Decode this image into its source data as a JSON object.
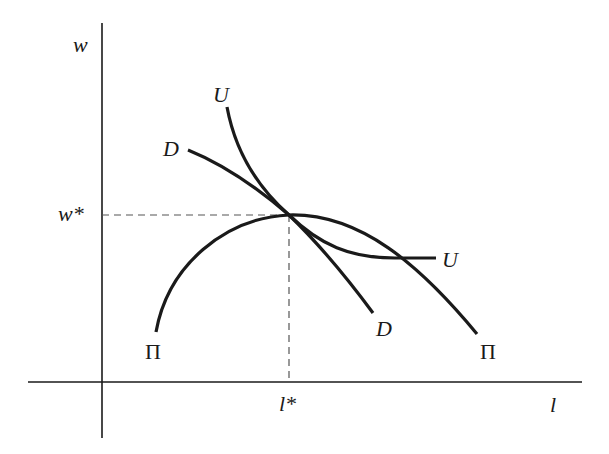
{
  "diagram": {
    "axes": {
      "y_label": "w",
      "x_label": "l",
      "y_star_label": "w*",
      "x_star_label": "l*"
    },
    "curves": [
      {
        "id": "U",
        "label_start": "U",
        "label_end": "U",
        "description": "indifference curve tangent at (l*, w*)"
      },
      {
        "id": "D",
        "label_start": "D",
        "label_end": "D",
        "description": "labor demand curve through (l*, w*)"
      },
      {
        "id": "Pi",
        "label_start": "Π",
        "label_end": "Π",
        "description": "isoprofit curve peaking at (l*, w*)"
      }
    ],
    "equilibrium": {
      "x": "l*",
      "y": "w*"
    },
    "colors": {
      "stroke": "#1a1a1a",
      "dashed": "#555555",
      "background": "#ffffff"
    }
  }
}
